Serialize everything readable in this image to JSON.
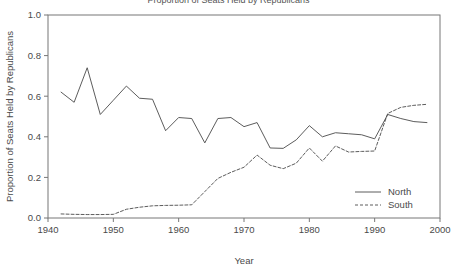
{
  "chart_data": {
    "type": "line",
    "title": "Proportion of Seats Held by Republicans",
    "xlabel": "Year",
    "ylabel": "Proportion of Seats Held by Republicans",
    "xlim": [
      1940,
      2000
    ],
    "ylim": [
      0.0,
      1.0
    ],
    "grid": false,
    "legend_position": "bottom-right",
    "x_ticks": [
      "1940",
      "1950",
      "1960",
      "1970",
      "1980",
      "1990",
      "2000"
    ],
    "x_tick_values": [
      1940,
      1950,
      1960,
      1970,
      1980,
      1990,
      2000
    ],
    "y_ticks": [
      "0.0",
      "0.2",
      "0.4",
      "0.6",
      "0.8",
      "1.0"
    ],
    "y_tick_values": [
      0.0,
      0.2,
      0.4,
      0.6,
      0.8,
      1.0
    ],
    "x": [
      1942,
      1944,
      1946,
      1948,
      1950,
      1952,
      1954,
      1956,
      1958,
      1960,
      1962,
      1964,
      1966,
      1968,
      1970,
      1972,
      1974,
      1976,
      1978,
      1980,
      1982,
      1984,
      1986,
      1988,
      1990,
      1992,
      1994,
      1996,
      1998
    ],
    "series": [
      {
        "name": "North",
        "style": "solid",
        "color": "#4a4a4a",
        "values": [
          0.62,
          0.57,
          0.74,
          0.51,
          0.58,
          0.65,
          0.59,
          0.585,
          0.43,
          0.495,
          0.49,
          0.37,
          0.49,
          0.495,
          0.45,
          0.47,
          0.345,
          0.343,
          0.385,
          0.455,
          0.4,
          0.42,
          0.415,
          0.41,
          0.39,
          0.51,
          0.49,
          0.475,
          0.47
        ]
      },
      {
        "name": "South",
        "style": "dashed",
        "color": "#4a4a4a",
        "values": [
          0.02,
          0.018,
          0.017,
          0.017,
          0.018,
          0.043,
          0.053,
          0.06,
          0.062,
          0.063,
          0.065,
          0.13,
          0.195,
          0.225,
          0.25,
          0.31,
          0.26,
          0.243,
          0.27,
          0.345,
          0.28,
          0.355,
          0.325,
          0.328,
          0.33,
          0.515,
          0.545,
          0.555,
          0.56
        ]
      }
    ]
  },
  "legend": {
    "entries": [
      {
        "label": "North",
        "style": "solid"
      },
      {
        "label": "South",
        "style": "dashed"
      }
    ]
  },
  "axes": {
    "x_axis_title": "Year",
    "y_axis_title": "Proportion of Seats Held by Republicans"
  }
}
